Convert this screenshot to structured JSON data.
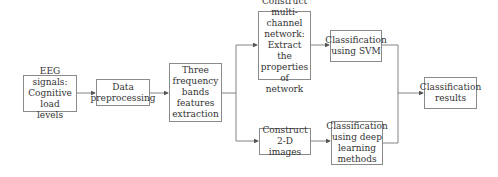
{
  "diagram": {
    "type": "flowchart",
    "nodes": [
      {
        "id": "eeg",
        "label": "EEG signals: Cognitive load levels"
      },
      {
        "id": "pre",
        "label": "Data preprocessing"
      },
      {
        "id": "freq",
        "label": "Three frequency bands features extraction"
      },
      {
        "id": "net",
        "label": "Construct multi-channel network: Extract the properties of network"
      },
      {
        "id": "img",
        "label": "Construct 2-D images"
      },
      {
        "id": "svm",
        "label": "Classification using SVM"
      },
      {
        "id": "dl",
        "label": "Classification using deep learning methods"
      },
      {
        "id": "res",
        "label": "Classification results"
      }
    ],
    "edges": [
      [
        "eeg",
        "pre"
      ],
      [
        "pre",
        "freq"
      ],
      [
        "freq",
        "net"
      ],
      [
        "freq",
        "img"
      ],
      [
        "net",
        "svm"
      ],
      [
        "img",
        "dl"
      ],
      [
        "svm",
        "res"
      ],
      [
        "dl",
        "res"
      ]
    ]
  },
  "colors": {
    "border": "#8a8a8a",
    "line": "#555555",
    "text": "#333333"
  }
}
